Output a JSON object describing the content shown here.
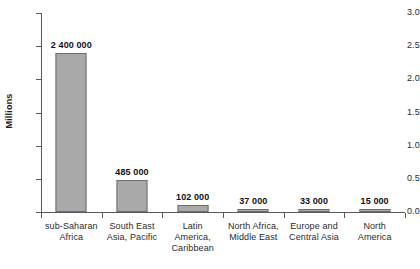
{
  "chart_data": {
    "type": "bar",
    "title": "",
    "xlabel": "",
    "ylabel": "Millions",
    "ylim": [
      0,
      3.0
    ],
    "ytick_labels": [
      "0.0",
      "0.5",
      "1.0",
      "1.5",
      "2.0",
      "2.5",
      "3.0"
    ],
    "ytick_values": [
      0.0,
      0.5,
      1.0,
      1.5,
      2.0,
      2.5,
      3.0
    ],
    "grid": false,
    "legend": null,
    "categories": [
      "sub-Saharan Africa",
      "South East Asia, Pacific",
      "Latin America, Caribbean",
      "North Africa, Middle East",
      "Europe and Central Asia",
      "North America"
    ],
    "category_lines": [
      [
        "sub-Saharan",
        "Africa"
      ],
      [
        "South East",
        "Asia, Pacific"
      ],
      [
        "Latin",
        "America,",
        "Caribbean"
      ],
      [
        "North Africa,",
        "Middle East"
      ],
      [
        "Europe and",
        "Central Asia"
      ],
      [
        "North",
        "America"
      ]
    ],
    "values": [
      2400000,
      485000,
      102000,
      37000,
      33000,
      15000
    ],
    "value_labels": [
      "2 400 000",
      "485 000",
      "102 000",
      "37 000",
      "33 000",
      "15 000"
    ],
    "bar_color": "#a9a9a9",
    "bar_edge_color": "#6e6e6e",
    "axis_color": "#5a5a5a"
  }
}
